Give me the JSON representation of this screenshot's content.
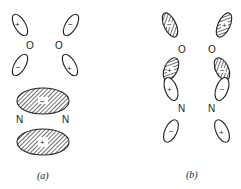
{
  "figure": {
    "panel_a": {
      "caption": "(a)",
      "oxygen_left": {
        "label": "O",
        "upper_lobe_sign": "+",
        "lower_lobe_sign": "−"
      },
      "oxygen_right": {
        "label": "O",
        "upper_lobe_sign": "−",
        "lower_lobe_sign": "+"
      },
      "nitrogen_left": {
        "label": "N"
      },
      "nitrogen_right": {
        "label": "N"
      },
      "upper_bond_lobe_sign": "−",
      "lower_bond_lobe_sign": "+"
    },
    "panel_b": {
      "caption": "(b)",
      "oxygen_left": {
        "label": "O",
        "upper_lobe_sign": "−",
        "lower_lobe_sign": "+"
      },
      "oxygen_right": {
        "label": "O",
        "upper_lobe_sign": "+",
        "lower_lobe_sign": "−"
      },
      "nitrogen_left": {
        "label": "N",
        "upper_lobe_sign": "+",
        "lower_lobe_sign": "−"
      },
      "nitrogen_right": {
        "label": "N",
        "upper_lobe_sign": "−",
        "lower_lobe_sign": "+"
      }
    },
    "colors": {
      "ink": "#222222",
      "background": "#ffffff"
    }
  }
}
